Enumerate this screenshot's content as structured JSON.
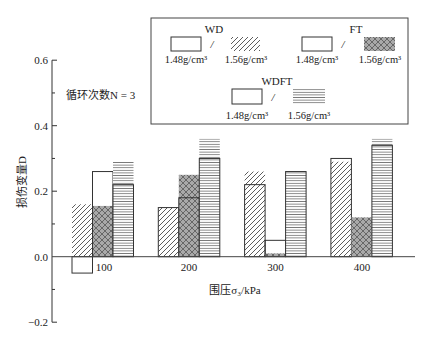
{
  "chart_data": {
    "type": "bar",
    "title": "",
    "xlabel": "围压σ₃/kPa",
    "ylabel": "损伤变量D",
    "categories": [
      "100",
      "200",
      "300",
      "400"
    ],
    "ylim": [
      -0.2,
      0.6
    ],
    "yticks": [
      -0.2,
      0.0,
      0.2,
      0.4,
      0.6
    ],
    "ytick_labels": [
      "−0.2",
      "0.0",
      "0.2",
      "0.4",
      "0.6"
    ],
    "grid": false,
    "annotation": "循环次数N = 3",
    "conditions": [
      "WD",
      "FT",
      "WDFT"
    ],
    "legend": {
      "position": "upper right",
      "separator": "/",
      "groups": [
        {
          "name": "WD",
          "items": [
            {
              "label": "1.48g/cm³",
              "style": "open"
            },
            {
              "label": "1.56g/cm³",
              "style": "hatch"
            }
          ]
        },
        {
          "name": "FT",
          "items": [
            {
              "label": "1.48g/cm³",
              "style": "open"
            },
            {
              "label": "1.56g/cm³",
              "style": "crosshatch"
            }
          ]
        },
        {
          "name": "WDFT",
          "items": [
            {
              "label": "1.48g/cm³",
              "style": "open"
            },
            {
              "label": "1.56g/cm³",
              "style": "hlines"
            }
          ]
        }
      ]
    },
    "series": [
      {
        "name": "WD 1.48g/cm³",
        "condition": "WD",
        "density": "1.48g/cm³",
        "density_id": "148",
        "style": "open",
        "values": [
          -0.05,
          0.15,
          0.22,
          0.3
        ]
      },
      {
        "name": "WD 1.56g/cm³",
        "condition": "WD",
        "density": "1.56g/cm³",
        "density_id": "156",
        "style": "hatch",
        "values": [
          0.16,
          0.15,
          0.26,
          0.29
        ]
      },
      {
        "name": "FT 1.48g/cm³",
        "condition": "FT",
        "density": "1.48g/cm³",
        "density_id": "148",
        "style": "open",
        "values": [
          0.26,
          0.18,
          0.05,
          0.0
        ]
      },
      {
        "name": "FT 1.56g/cm³",
        "condition": "FT",
        "density": "1.56g/cm³",
        "density_id": "156",
        "style": "crosshatch",
        "values": [
          0.155,
          0.25,
          0.01,
          0.12
        ]
      },
      {
        "name": "WDFT 1.48g/cm³",
        "condition": "WDFT",
        "density": "1.48g/cm³",
        "density_id": "148",
        "style": "open",
        "values": [
          0.22,
          0.3,
          0.26,
          0.34
        ]
      },
      {
        "name": "WDFT 1.56g/cm³",
        "condition": "WDFT",
        "density": "1.56g/cm³",
        "density_id": "156",
        "style": "hlines",
        "values": [
          0.29,
          0.36,
          0.26,
          0.36
        ]
      }
    ]
  }
}
